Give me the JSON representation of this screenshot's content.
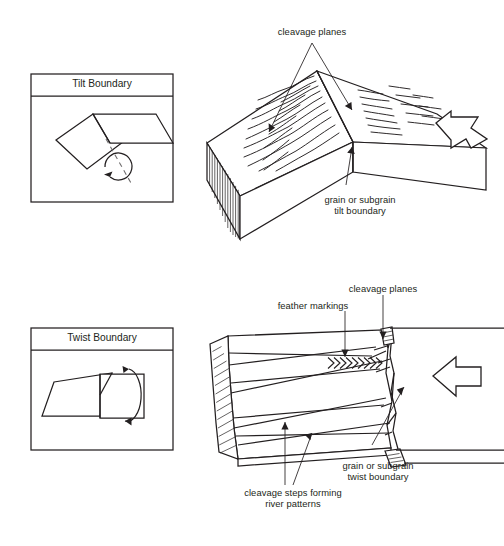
{
  "figure": {
    "bottom_caption": "",
    "ink_color": "#231f20",
    "paper_color": "#ffffff"
  },
  "tilt": {
    "box": {
      "title": "Tilt Boundary",
      "rotation_icon": "circular-rotation-arrow-icon",
      "axis_icon": "dashed-tilt-axis-icon"
    },
    "labels": {
      "cleavage_planes": "cleavage planes",
      "boundary_line1": "grain or subgrain",
      "boundary_line2": "tilt boundary"
    },
    "load_arrow_icon": "bent-outline-arrow-left-icon",
    "river_marks_icon": "river-pattern-lines-icon",
    "hatched_face_icon": "hatched-end-face-icon"
  },
  "twist": {
    "box": {
      "title": "Twist Boundary",
      "rotation_icon": "vertical-twist-rotation-arrow-icon"
    },
    "labels": {
      "cleavage_planes": "cleavage planes",
      "feather_markings": "feather markings",
      "steps_line1": "cleavage steps forming",
      "steps_line2": "river patterns",
      "boundary_line1": "grain or subgrain",
      "boundary_line2": "twist boundary"
    },
    "load_arrow_icon": "outline-arrow-left-icon",
    "chevron_band_icon": "chevron-band-right-icon",
    "chevron_count": 9,
    "hatched_face_icon": "hatched-end-face-icon"
  }
}
